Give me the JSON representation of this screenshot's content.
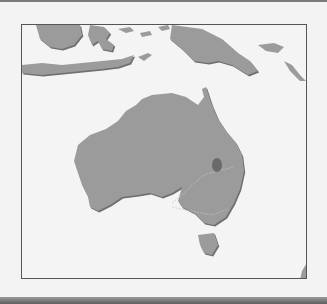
{
  "map": {
    "subject": "Australia and surrounding region",
    "highlighted_region": "Central Australian inland area (dark spot)",
    "colors": {
      "background": "#f3f3f3",
      "ocean": "#f4f4f4",
      "land": "#9b9b9b",
      "highlight": "#6a6a6a",
      "frame_border": "#555555"
    }
  }
}
